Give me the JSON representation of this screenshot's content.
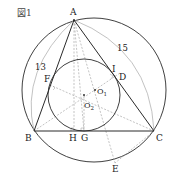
{
  "figure": {
    "title": "図1"
  },
  "colors": {
    "line": "#2a2a2a",
    "dashed": "#9a9a9a",
    "arc": "#a8a8a8",
    "text": "#222222"
  },
  "points": {
    "A": {
      "label": "A",
      "x": 74,
      "y": 20
    },
    "B": {
      "label": "B",
      "x": 34,
      "y": 131
    },
    "C": {
      "label": "C",
      "x": 154,
      "y": 131
    },
    "D": {
      "label": "D",
      "x": 120,
      "y": 73
    },
    "E": {
      "label": "E",
      "x": 115,
      "y": 163
    },
    "F": {
      "label": "F",
      "x": 50,
      "y": 85
    },
    "G": {
      "label": "G",
      "x": 84,
      "y": 131
    },
    "H": {
      "label": "H",
      "x": 74,
      "y": 131
    },
    "I": {
      "label": "I",
      "x": 115,
      "y": 68
    },
    "O1": {
      "label": "O",
      "sub": "1",
      "x": 95,
      "y": 90
    },
    "O2": {
      "label": "O",
      "sub": "2",
      "x": 84,
      "y": 95
    }
  },
  "lengths": {
    "AB": "13",
    "AC": "15"
  },
  "circles": {
    "circumcircle": {
      "cx": 94,
      "cy": 90,
      "r": 72
    },
    "incircle": {
      "cx": 84,
      "cy": 95,
      "r": 36
    }
  }
}
